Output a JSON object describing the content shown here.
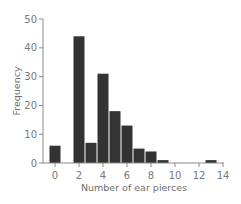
{
  "chart_data": {
    "type": "bar",
    "title": "",
    "xlabel": "Number of ear pierces",
    "ylabel": "Frequency",
    "x": [
      0,
      1,
      2,
      3,
      4,
      5,
      6,
      7,
      8,
      9,
      10,
      11,
      12,
      13,
      14
    ],
    "values": [
      6,
      0,
      44,
      7,
      31,
      18,
      13,
      5,
      4,
      1,
      0,
      0,
      0,
      1,
      0
    ],
    "xticks": [
      "0",
      "2",
      "4",
      "6",
      "8",
      "10",
      "12",
      "14"
    ],
    "yticks": [
      "0",
      "10",
      "20",
      "30",
      "40",
      "50"
    ],
    "xlim": [
      -0.5,
      14
    ],
    "ylim": [
      0,
      50
    ],
    "grid": false,
    "legend": null,
    "bar_color": "#333333",
    "axis_color": "#8a8a8a"
  }
}
